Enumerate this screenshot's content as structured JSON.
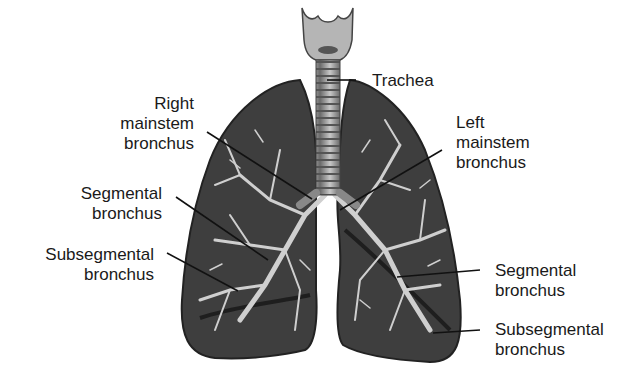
{
  "diagram": {
    "labels": {
      "trachea": [
        "Trachea"
      ],
      "right_mainstem": [
        "Right",
        "mainstem",
        "bronchus"
      ],
      "segmental_right": [
        "Segmental",
        "bronchus"
      ],
      "subsegmental_right": [
        "Subsegmental",
        "bronchus"
      ],
      "left_mainstem": [
        "Left",
        "mainstem",
        "bronchus"
      ],
      "segmental_left": [
        "Segmental",
        "bronchus"
      ],
      "subsegmental_left": [
        "Subsegmental",
        "bronchus"
      ]
    },
    "colors": {
      "lung_fill": "#3e3e3e",
      "lung_edge": "#222222",
      "airway": "#cfcfcf",
      "trachea": "#9a9a9a",
      "leader": "#111111",
      "text": "#1a1a1a"
    }
  }
}
